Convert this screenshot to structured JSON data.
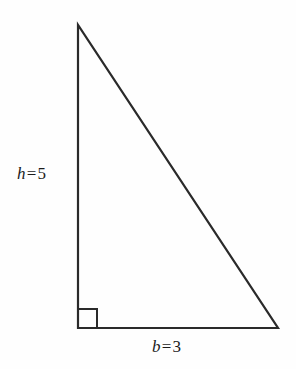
{
  "figure": {
    "name": "right-triangle-diagram",
    "type": "geometry-diagram",
    "background_color": "#fefefe",
    "stroke_color": "#2a2a2a",
    "stroke_width": 2.2
  },
  "labels": {
    "height": {
      "variable": "h",
      "operator": "=",
      "value": "5",
      "full": "h = 5"
    },
    "base": {
      "variable": "b",
      "operator": "=",
      "value": "3",
      "full": "b = 3"
    }
  },
  "chart_data": {
    "type": "diagram",
    "shape": "right triangle",
    "title": "",
    "vertices": [
      {
        "name": "apex",
        "x": 78,
        "y": 25
      },
      {
        "name": "bottom-left",
        "x": 78,
        "y": 328
      },
      {
        "name": "bottom-right",
        "x": 278,
        "y": 328
      }
    ],
    "edges": [
      {
        "name": "height-leg",
        "from": "apex",
        "to": "bottom-left",
        "label": "h = 5"
      },
      {
        "name": "base-leg",
        "from": "bottom-left",
        "to": "bottom-right",
        "label": "b = 3"
      },
      {
        "name": "hypotenuse",
        "from": "bottom-left",
        "to": "apex",
        "label": ""
      }
    ],
    "annotations": [
      {
        "name": "right-angle-marker",
        "at": "bottom-left",
        "size": 19
      }
    ],
    "measurements": {
      "h": 5,
      "b": 3
    },
    "grid": false,
    "legend": null
  }
}
